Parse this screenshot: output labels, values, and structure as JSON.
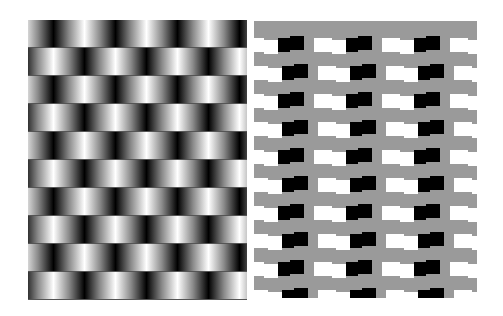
{
  "figure": {
    "left_panel": {
      "type": "gradient-band-illusion",
      "rows": 10,
      "row_height": 28,
      "period": 62,
      "offsets": [
        0,
        31
      ],
      "gradient_stops": [
        "#8a8a8a",
        "#000000",
        "#8a8a8a",
        "#ffffff",
        "#8a8a8a"
      ]
    },
    "right_panel": {
      "type": "cafe-wall-illusion",
      "background": "#9a9a9a",
      "rows": 10,
      "row_pitch": 28,
      "tile_height": 14,
      "period": 68,
      "colors": {
        "dark": "#000000",
        "light": "#ffffff"
      }
    }
  }
}
